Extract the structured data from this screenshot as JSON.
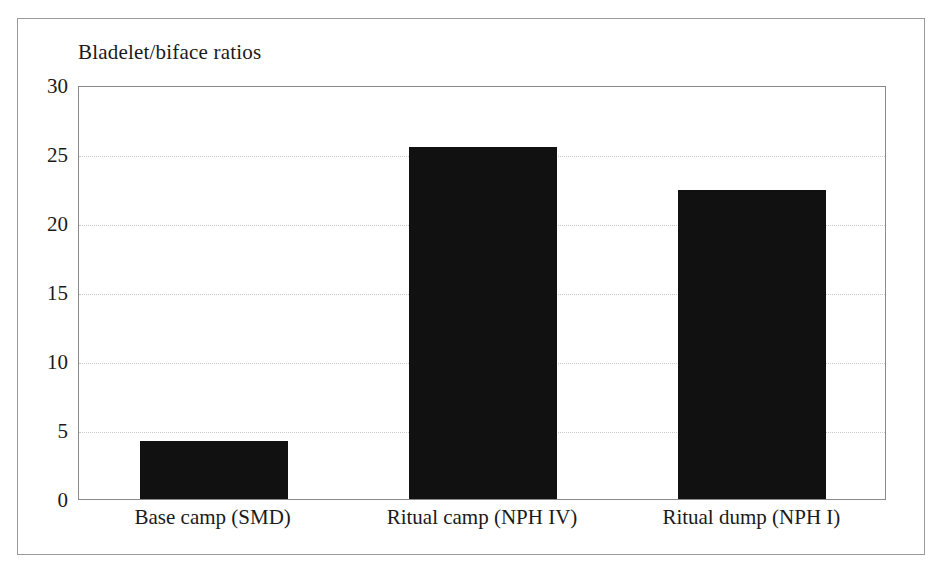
{
  "chart_data": {
    "type": "bar",
    "title": "Bladelet/biface ratios",
    "xlabel": "",
    "ylabel": "",
    "categories": [
      "Base camp (SMD)",
      "Ritual camp (NPH IV)",
      "Ritual dump (NPH I)"
    ],
    "values": [
      4.2,
      25.5,
      22.4
    ],
    "ylim": [
      0,
      30
    ],
    "yticks": [
      0,
      5,
      10,
      15,
      20,
      25,
      30
    ],
    "ytick_labels": [
      "0",
      "5",
      "10",
      "15",
      "20",
      "25",
      "30"
    ],
    "grid": true,
    "grid_style": "dotted",
    "legend": false,
    "legend_position": "none",
    "bar_color": "#111111",
    "grid_color": "#c9c9c9",
    "axis_color": "#8a8a8a",
    "frame_color": "#9a9a9a",
    "text_color": "#1a1a1a"
  }
}
